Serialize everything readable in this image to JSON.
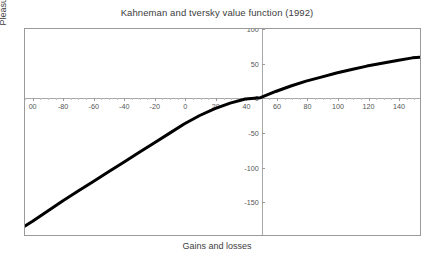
{
  "chart_data": {
    "type": "line",
    "title": "Kahneman and tversky value function (1992)",
    "xlabel": "Gains and losses",
    "ylabel": "Pleasure/pain",
    "xlim": [
      -105,
      155
    ],
    "ylim": [
      -200,
      100
    ],
    "grid": false,
    "legend": null,
    "xticks": [
      -100,
      -80,
      -60,
      -40,
      -20,
      0,
      20,
      40,
      60,
      80,
      100,
      120,
      140
    ],
    "xtick_labels": [
      "00",
      "-80",
      "-60",
      "-40",
      "-20",
      "0",
      "20",
      "40",
      "60",
      "80",
      "100",
      "120",
      "140"
    ],
    "yticks": [
      100,
      50,
      0,
      -50,
      -100,
      -150,
      -200
    ],
    "ytick_labels": [
      "100",
      "50",
      "0",
      "-50",
      "-100",
      "-150",
      "-200"
    ],
    "x_axis_crossing": 0,
    "y_axis_crossing": 50,
    "series": [
      {
        "name": "value function",
        "color": "#000000",
        "line_width": 3,
        "x": [
          -105,
          -100,
          -90,
          -80,
          -70,
          -60,
          -50,
          -40,
          -30,
          -20,
          -10,
          0,
          10,
          20,
          30,
          40,
          50,
          60,
          70,
          80,
          90,
          100,
          110,
          120,
          130,
          140,
          150,
          155
        ],
        "y": [
          -187,
          -180,
          -165,
          -150,
          -136,
          -122,
          -108,
          -94,
          -80,
          -66,
          -52,
          -38,
          -26,
          -16,
          -8,
          -2,
          0,
          9,
          17,
          24,
          30,
          36,
          41,
          46,
          50,
          54,
          58,
          59
        ]
      }
    ]
  }
}
